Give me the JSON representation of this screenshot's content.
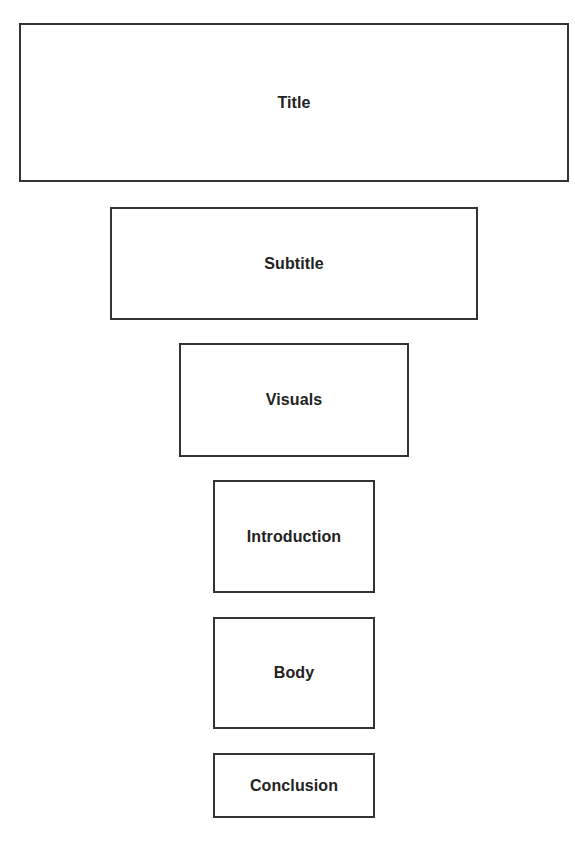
{
  "diagram": {
    "type": "inverted-pyramid / funnel stack",
    "top_caption_partial": "",
    "border_color": "#333333",
    "text_color": "#222222",
    "boxes": [
      {
        "label": "Title",
        "x": 19,
        "y": 23,
        "w": 550,
        "h": 159
      },
      {
        "label": "Subtitle",
        "x": 110,
        "y": 207,
        "w": 368,
        "h": 113
      },
      {
        "label": "Visuals",
        "x": 179,
        "y": 343,
        "w": 230,
        "h": 114
      },
      {
        "label": "Introduction",
        "x": 213,
        "y": 480,
        "w": 162,
        "h": 113
      },
      {
        "label": "Body",
        "x": 213,
        "y": 617,
        "w": 162,
        "h": 112
      },
      {
        "label": "Conclusion",
        "x": 213,
        "y": 753,
        "w": 162,
        "h": 65
      }
    ]
  }
}
